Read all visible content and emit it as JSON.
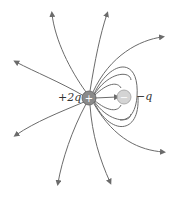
{
  "diagram": {
    "charges": [
      {
        "id": "positive",
        "symbol": "+",
        "label": "+2q",
        "x": 89,
        "y": 98,
        "color": "#8a8a8a"
      },
      {
        "id": "negative",
        "symbol": "−",
        "label": "−q",
        "x": 124,
        "y": 97,
        "color": "#d4d4d4"
      }
    ],
    "line_color": "#6b6b6b"
  }
}
